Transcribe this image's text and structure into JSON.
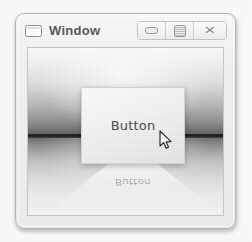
{
  "window": {
    "title": "Window",
    "icon": "window-restore-icon",
    "controls": [
      {
        "name": "minimize",
        "label": "–",
        "glyph": "minimize-icon"
      },
      {
        "name": "maximize",
        "label": "□",
        "glyph": "maximize-icon"
      },
      {
        "name": "close",
        "label": "✕",
        "glyph": "close-icon"
      }
    ]
  },
  "scene": {
    "button": {
      "label": "Button"
    },
    "reflection": {
      "label": "Button"
    },
    "cursor": {
      "name": "arrow-pointer"
    }
  },
  "colors": {
    "frame_border": "#b9b9b9",
    "title_text": "#5a5a5a",
    "button_text": "#4b4b4b",
    "horizon": "#1a1a1a",
    "panel_face": "#f3f3f3"
  }
}
